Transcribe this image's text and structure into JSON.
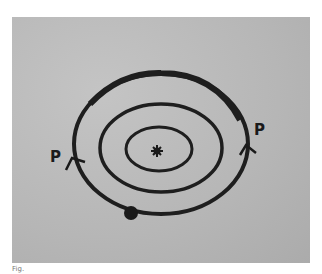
{
  "diagram": {
    "labels": {
      "left": "P",
      "right": "P"
    },
    "center": "nucleus",
    "orbits": 3,
    "colors": {
      "background": "#b9b9b9",
      "ink": "#1a1a1a"
    }
  },
  "caption": "Fig."
}
